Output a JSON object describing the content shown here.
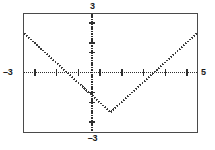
{
  "window": {
    "title": "Graphing Calculator Plot"
  },
  "labels": {
    "ymax": "3",
    "ymin": "–3",
    "xmin": "–3",
    "xmax": "5"
  },
  "chart_data": {
    "type": "line",
    "title": "",
    "subtitle": "",
    "xlabel": "",
    "ylabel": "",
    "xlim": [
      -3,
      5
    ],
    "ylim": [
      -3,
      3
    ],
    "grid": false,
    "legend": null,
    "axes": {
      "x_axis_at_y": 0,
      "y_axis_at_x": 0,
      "x_tick_interval": 0.5,
      "y_tick_interval": 0.25,
      "tick_style": "dotted"
    },
    "annotations": [
      {
        "text": "3",
        "position": "top-of-y-axis",
        "value": 3
      },
      {
        "text": "–3",
        "position": "bottom-of-y-axis",
        "value": -3
      },
      {
        "text": "–3",
        "position": "left-of-x-axis",
        "value": -3
      },
      {
        "text": "5",
        "position": "right-of-x-axis",
        "value": 5
      }
    ],
    "series": [
      {
        "name": "y = |x - 1| - 2",
        "style": "dotted",
        "color": "#3c3c3c",
        "vertex": [
          1,
          -2
        ],
        "x_intercepts": [
          -1,
          3
        ],
        "y_intercept": -1,
        "x": [
          -3,
          -2.5,
          -2,
          -1.5,
          -1,
          -0.5,
          0,
          0.5,
          1,
          1.5,
          2,
          2.5,
          3,
          3.5,
          4,
          4.5,
          5
        ],
        "values": [
          2,
          1.5,
          1,
          0.5,
          0,
          -0.5,
          -1,
          -1.5,
          -2,
          -1.5,
          -1,
          -0.5,
          0,
          0.5,
          1,
          1.5,
          2
        ]
      }
    ]
  }
}
